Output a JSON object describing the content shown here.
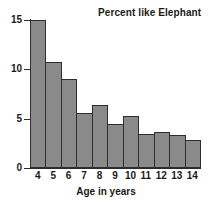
{
  "chart_data": {
    "type": "bar",
    "title": "Percent like Elephant",
    "xlabel": "Age in years",
    "ylabel": "",
    "categories": [
      "4",
      "5",
      "6",
      "7",
      "8",
      "9",
      "10",
      "11",
      "12",
      "13",
      "14"
    ],
    "values": [
      15.0,
      10.7,
      9.0,
      5.6,
      6.4,
      4.5,
      5.3,
      3.4,
      3.6,
      3.3,
      2.8
    ],
    "ylim": [
      0,
      15
    ],
    "yticks": [
      0,
      5,
      10,
      15
    ],
    "ytick_labels": [
      "0",
      "5",
      "10",
      "15"
    ],
    "grid": false,
    "legend": null,
    "bar_color": "#8a8a8a",
    "bar_edge_color": "#2e2e2e",
    "axis_color": "#2b2b2b",
    "background": "#ffffff"
  }
}
